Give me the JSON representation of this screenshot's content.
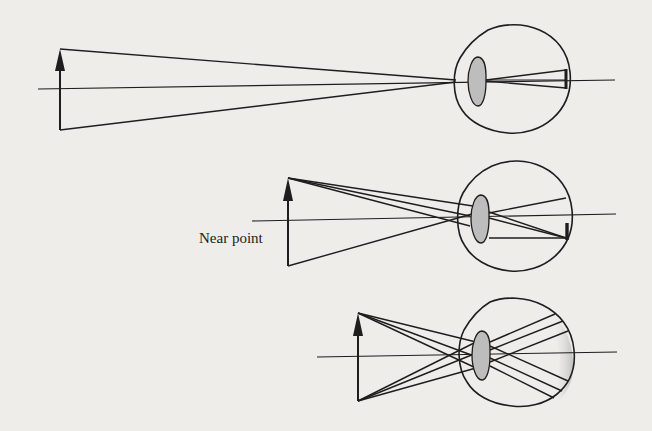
{
  "figure": {
    "colors": {
      "background": "#eeede9",
      "ink": "#1e1e1e",
      "lens_fill": "#bdbdbd",
      "retina_shade": "#c9c9c9"
    },
    "panels": [
      {
        "id": "distant-object",
        "arrow": {
          "x": 60,
          "top": 49,
          "bottom": 130
        },
        "axis": {
          "y": 88,
          "x1": 38,
          "x2": 615
        },
        "eye": {
          "left": 454,
          "right": 570,
          "top": 27,
          "bottom": 133
        },
        "label": ""
      },
      {
        "id": "near-point-object",
        "arrow": {
          "x": 288,
          "top": 178,
          "bottom": 266
        },
        "axis": {
          "y": 220,
          "x1": 252,
          "x2": 616
        },
        "eye": {
          "left": 458,
          "right": 572,
          "top": 163,
          "bottom": 272
        },
        "label": "Near point"
      },
      {
        "id": "too-close-object",
        "arrow": {
          "x": 358,
          "top": 313,
          "bottom": 401
        },
        "axis": {
          "y": 357,
          "x1": 317,
          "x2": 617
        },
        "eye": {
          "left": 456,
          "right": 575,
          "top": 298,
          "bottom": 406
        },
        "label": ""
      }
    ]
  },
  "labels": {
    "near_point": "Near point"
  }
}
